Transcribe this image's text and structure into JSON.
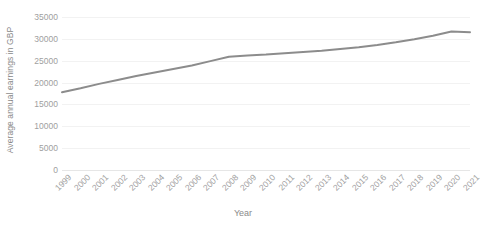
{
  "chart_data": {
    "type": "line",
    "title": "",
    "xlabel": "Year",
    "ylabel": "Average annual earnings in GBP",
    "x": [
      "1999",
      "2000",
      "2001",
      "2002",
      "2003",
      "2004",
      "2005",
      "2006",
      "2007",
      "2008",
      "2009",
      "2010",
      "2011",
      "2012",
      "2013",
      "2014",
      "2015",
      "2016",
      "2017",
      "2018",
      "2019",
      "2020",
      "2021"
    ],
    "categories": [
      "1999",
      "2000",
      "2001",
      "2002",
      "2003",
      "2004",
      "2005",
      "2006",
      "2007",
      "2008",
      "2009",
      "2010",
      "2011",
      "2012",
      "2013",
      "2014",
      "2015",
      "2016",
      "2017",
      "2018",
      "2019",
      "2020",
      "2021"
    ],
    "values": [
      17800,
      18700,
      19700,
      20600,
      21500,
      22300,
      23100,
      23900,
      24900,
      25900,
      26200,
      26400,
      26700,
      27000,
      27300,
      27700,
      28100,
      28600,
      29200,
      29900,
      30700,
      31700,
      31500
    ],
    "series": [
      {
        "name": "Average annual earnings in GBP",
        "color": "#8c8c8c",
        "values": [
          17800,
          18700,
          19700,
          20600,
          21500,
          22300,
          23100,
          23900,
          24900,
          25900,
          26200,
          26400,
          26700,
          27000,
          27300,
          27700,
          28100,
          28600,
          29200,
          29900,
          30700,
          31700,
          31500
        ]
      }
    ],
    "ylim": [
      0,
      35000
    ],
    "yticks": [
      0,
      5000,
      10000,
      15000,
      20000,
      25000,
      30000,
      35000
    ],
    "ytick_labels": [
      "0",
      "5000",
      "10000",
      "15000",
      "20000",
      "25000",
      "30000",
      "35000"
    ],
    "grid": true,
    "grid_axis": "y",
    "legend": false,
    "legend_position": "none",
    "line_width": 2,
    "marker": "none"
  },
  "axis": {
    "y_title": "Average annual earnings in GBP",
    "x_title": "Year"
  },
  "colors": {
    "line": "#8c8c8c",
    "gridline": "#f2f2f2",
    "baseline": "#e6e6e6",
    "tick_text": "#a0a0a0",
    "title_text": "#8a8a8a",
    "background": "#ffffff"
  }
}
